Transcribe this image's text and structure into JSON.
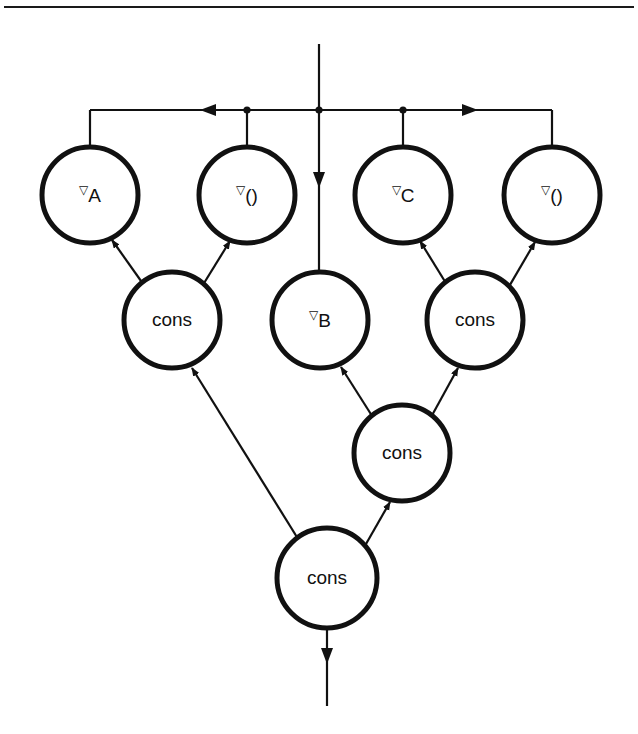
{
  "figure": {
    "background_color": "#ffffff",
    "line_color": "#111111",
    "width": 638,
    "height": 734,
    "top_rule": {
      "name": "top-rule",
      "y": 7,
      "x1": 4,
      "x2": 634
    }
  },
  "symbols": {
    "nabla": "▽",
    "parens": "()"
  },
  "nodes": [
    {
      "id": "nabla-a",
      "label": "▽A",
      "nabla": "▽",
      "text": "A",
      "cx": 90,
      "cy": 195,
      "r": 48,
      "level": 1,
      "kind": "delta-var"
    },
    {
      "id": "nabla-paren-1",
      "label": "▽()",
      "nabla": "▽",
      "text": "()",
      "cx": 247,
      "cy": 195,
      "r": 48,
      "level": 1,
      "kind": "delta-paren"
    },
    {
      "id": "nabla-c",
      "label": "▽C",
      "nabla": "▽",
      "text": "C",
      "cx": 403,
      "cy": 195,
      "r": 48,
      "level": 1,
      "kind": "delta-var"
    },
    {
      "id": "nabla-paren-2",
      "label": "▽()",
      "nabla": "▽",
      "text": "()",
      "cx": 552,
      "cy": 195,
      "r": 48,
      "level": 1,
      "kind": "delta-paren"
    },
    {
      "id": "cons-left",
      "label": "cons",
      "nabla": "",
      "text": "cons",
      "cx": 172,
      "cy": 320,
      "r": 48,
      "level": 2,
      "kind": "cons"
    },
    {
      "id": "nabla-b",
      "label": "▽B",
      "nabla": "▽",
      "text": "B",
      "cx": 320,
      "cy": 320,
      "r": 48,
      "level": 2,
      "kind": "delta-var"
    },
    {
      "id": "cons-right",
      "label": "cons",
      "nabla": "",
      "text": "cons",
      "cx": 475,
      "cy": 320,
      "r": 48,
      "level": 2,
      "kind": "cons"
    },
    {
      "id": "cons-mid",
      "label": "cons",
      "nabla": "",
      "text": "cons",
      "cx": 402,
      "cy": 453,
      "r": 48,
      "level": 3,
      "kind": "cons"
    },
    {
      "id": "cons-bottom",
      "label": "cons",
      "nabla": "",
      "text": "cons",
      "cx": 327,
      "cy": 578,
      "r": 50,
      "level": 4,
      "kind": "cons"
    }
  ],
  "bus": {
    "name": "distribution-bus",
    "y": 110,
    "x_left": 90,
    "x_right": 552,
    "left_arrow_x": 218,
    "right_arrow_x": 462,
    "junction_dots": [
      {
        "id": "dot-left",
        "x": 247,
        "y": 110
      },
      {
        "id": "dot-center",
        "x": 319,
        "y": 110
      },
      {
        "id": "dot-right",
        "x": 403,
        "y": 110
      }
    ],
    "drops": [
      {
        "id": "drop-a",
        "x": 90,
        "y1": 110,
        "y2": 147
      },
      {
        "id": "drop-paren-1",
        "x": 247,
        "y1": 110,
        "y2": 147
      },
      {
        "id": "drop-c",
        "x": 403,
        "y1": 110,
        "y2": 147
      },
      {
        "id": "drop-paren-2",
        "x": 552,
        "y1": 110,
        "y2": 147
      }
    ]
  },
  "io": {
    "input": {
      "name": "input-arrow",
      "x": 319,
      "y1": 44,
      "y2": 272,
      "arrow_at_y": 182,
      "label": ""
    },
    "output": {
      "name": "output-arrow",
      "x": 327,
      "y1": 628,
      "y2": 706,
      "arrow_at_y": 660,
      "label": ""
    }
  },
  "edges": [
    {
      "id": "edge-consleft-to-a",
      "from": "cons-left",
      "to": "nabla-a",
      "arrow": "to-head",
      "x1": 143,
      "y1": 282,
      "x2": 110,
      "y2": 238
    },
    {
      "id": "edge-consleft-to-paren1",
      "from": "cons-left",
      "to": "nabla-paren-1",
      "arrow": "to-head",
      "x1": 203,
      "y1": 284,
      "x2": 231,
      "y2": 239
    },
    {
      "id": "edge-consright-to-c",
      "from": "cons-right",
      "to": "nabla-c",
      "arrow": "to-head",
      "x1": 447,
      "y1": 283,
      "x2": 419,
      "y2": 239
    },
    {
      "id": "edge-consright-to-paren2",
      "from": "cons-right",
      "to": "nabla-paren-2",
      "arrow": "to-head",
      "x1": 509,
      "y1": 286,
      "x2": 536,
      "y2": 240
    },
    {
      "id": "edge-consmid-to-b",
      "from": "cons-mid",
      "to": "nabla-b",
      "arrow": "to-head",
      "x1": 372,
      "y1": 414,
      "x2": 340,
      "y2": 365
    },
    {
      "id": "edge-consmid-to-consright",
      "from": "cons-mid",
      "to": "cons-right",
      "arrow": "to-head",
      "x1": 432,
      "y1": 415,
      "x2": 459,
      "y2": 366
    },
    {
      "id": "edge-consbottom-to-consleft",
      "from": "cons-bottom",
      "to": "cons-left",
      "arrow": "to-head",
      "x1": 299,
      "y1": 538,
      "x2": 190,
      "y2": 366
    },
    {
      "id": "edge-consbottom-to-consmid",
      "from": "cons-bottom",
      "to": "cons-mid",
      "arrow": "to-head",
      "x1": 364,
      "y1": 548,
      "x2": 391,
      "y2": 500
    }
  ],
  "legend": {
    "node_kinds": [
      "delta-var",
      "delta-paren",
      "cons"
    ],
    "cons_label": "cons"
  }
}
